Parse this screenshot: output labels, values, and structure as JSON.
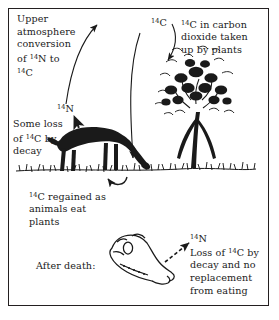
{
  "diagram": {
    "border_color": "#231f20",
    "ink_color": "#1a1a1a",
    "background": "#ffffff"
  },
  "labels": {
    "upper_atmosphere": "Upper atmosphere conversion of ¹⁴N to ¹⁴C",
    "carbon_dioxide": "¹⁴C in carbon dioxide taken up by plants",
    "some_loss": "Some loss of ¹⁴C by decay",
    "regained": "¹⁴C regained as animals eat plants",
    "after_death": "After death:",
    "loss_no_replacement": "Loss of ¹⁴C by decay and no replacement from eating"
  },
  "isotopes": {
    "c14_top": "¹⁴C",
    "n14_middle": "¹⁴N",
    "n14_skull": "¹⁴N"
  },
  "figures": [
    {
      "name": "tree",
      "description": "leafy tree taking up carbon dioxide"
    },
    {
      "name": "grazing-horse",
      "description": "dark silhouette of horse eating grass"
    },
    {
      "name": "horse-skull",
      "description": "outline drawing of a horse skull after death"
    },
    {
      "name": "ground-line",
      "description": "grass ground line"
    }
  ],
  "arrows": [
    {
      "name": "arrow-n14-to-c14",
      "style": "solid-curve",
      "from": "nitrogen-14",
      "to": "carbon-14"
    },
    {
      "name": "arrow-c14-to-tree",
      "style": "solid-curve",
      "from": "carbon-14",
      "to": "tree"
    },
    {
      "name": "arrow-c14-to-ground",
      "style": "solid-long",
      "from": "carbon-14",
      "to": "ground"
    },
    {
      "name": "arrow-plants-to-animal",
      "style": "solid-hook",
      "from": "plants",
      "to": "animal"
    },
    {
      "name": "arrow-animal-decay",
      "style": "dashed",
      "from": "animal",
      "to": "nitrogen-14"
    },
    {
      "name": "arrow-skull-decay",
      "style": "dashed",
      "from": "skull",
      "to": "nitrogen-14"
    }
  ]
}
